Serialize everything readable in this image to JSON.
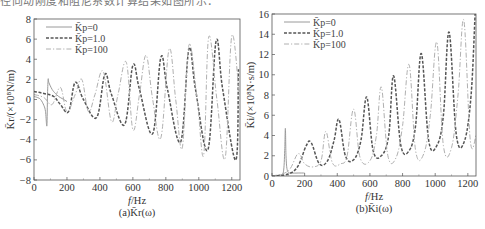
{
  "header_text": "径向动刚度和阻尼系数计算结果如图所示：",
  "chart_data": [
    {
      "id": "a",
      "type": "line",
      "title": "",
      "caption": "(a)K̄r(ω)",
      "xlabel": "f/Hz",
      "ylabel": "K̄r/(×10⁸N/m)",
      "xlim": [
        0,
        1250
      ],
      "ylim": [
        -8,
        8
      ],
      "xticks": [
        0,
        200,
        400,
        600,
        800,
        1000,
        1200
      ],
      "yticks": [
        -8,
        -6,
        -4,
        -2,
        0,
        2,
        4,
        6,
        8
      ],
      "grid": false,
      "legend_position": "upper-left",
      "series": [
        {
          "name": "K̄p=0",
          "style": "solid",
          "color": "#9a9a9a",
          "x": [
            0,
            20,
            40,
            60,
            70,
            78,
            82,
            86,
            90,
            110,
            130,
            150,
            170,
            200
          ],
          "y": [
            0.3,
            0.2,
            0.0,
            -0.6,
            -1.2,
            -2.6,
            0.5,
            2.0,
            1.7,
            1.0,
            0.6,
            0.3,
            0.1,
            -0.2
          ]
        },
        {
          "name": "K̄p=1.0",
          "style": "dashed",
          "color": "#555555",
          "x": [
            0,
            60,
            120,
            160,
            210,
            250,
            300,
            380,
            430,
            470,
            550,
            600,
            640,
            720,
            770,
            810,
            890,
            940,
            980,
            1055,
            1105,
            1145,
            1225,
            1240
          ],
          "y": [
            0.8,
            0.6,
            0.3,
            -0.5,
            -1.2,
            1.7,
            0.0,
            -1.8,
            2.5,
            0.5,
            -2.5,
            3.4,
            1.0,
            -3.4,
            4.2,
            1.0,
            -4.2,
            5.0,
            1.0,
            -5.0,
            5.8,
            1.0,
            -6.0,
            3.0
          ]
        },
        {
          "name": "K̄p=100",
          "style": "dash-dot",
          "color": "#b0b0b0",
          "x": [
            0,
            60,
            110,
            160,
            200,
            250,
            290,
            330,
            370,
            420,
            470,
            510,
            560,
            600,
            640,
            680,
            720,
            770,
            820,
            860,
            900,
            940,
            990,
            1030,
            1060,
            1110,
            1160,
            1200,
            1245
          ],
          "y": [
            0.5,
            0.2,
            -0.5,
            1.2,
            -1.2,
            0.5,
            2.0,
            -1.2,
            0.5,
            2.8,
            -2.2,
            0.5,
            3.7,
            -3.0,
            0.5,
            4.4,
            0.0,
            -3.8,
            5.0,
            0.0,
            -4.8,
            5.4,
            0.0,
            -5.5,
            6.2,
            0.0,
            -5.8,
            6.3,
            0.5
          ]
        }
      ]
    },
    {
      "id": "b",
      "type": "line",
      "title": "",
      "caption": "(b)K̄i(ω)",
      "xlabel": "f/Hz",
      "ylabel": "K̄i/(×10⁸N·s/m)",
      "xlim": [
        0,
        1250
      ],
      "ylim": [
        0,
        16
      ],
      "xticks": [
        0,
        200,
        400,
        600,
        800,
        1000,
        1200
      ],
      "yticks": [
        0,
        2,
        4,
        6,
        8,
        10,
        12,
        14,
        16
      ],
      "grid": false,
      "legend_position": "upper-left",
      "series": [
        {
          "name": "K̄p=0",
          "style": "solid",
          "color": "#9a9a9a",
          "x": [
            0,
            50,
            70,
            78,
            82,
            86,
            95,
            120,
            160,
            200
          ],
          "y": [
            0.0,
            0.1,
            0.4,
            2.5,
            4.7,
            2.0,
            0.5,
            0.3,
            0.3,
            0.3
          ]
        },
        {
          "name": "K̄p=1.0",
          "style": "dashed",
          "color": "#555555",
          "x": [
            0,
            100,
            160,
            210,
            240,
            290,
            340,
            380,
            410,
            450,
            500,
            545,
            580,
            620,
            670,
            715,
            745,
            790,
            840,
            880,
            915,
            960,
            1010,
            1050,
            1085,
            1130,
            1180,
            1220,
            1245
          ],
          "y": [
            0.0,
            0.2,
            1.0,
            3.0,
            3.3,
            1.2,
            1.5,
            3.5,
            5.6,
            2.0,
            1.6,
            3.5,
            7.8,
            2.5,
            2.0,
            4.0,
            9.9,
            3.0,
            2.5,
            5.0,
            12.1,
            3.5,
            3.0,
            6.0,
            14.2,
            4.0,
            3.5,
            8.0,
            16.2
          ]
        },
        {
          "name": "K̄p=100",
          "style": "dash-dot",
          "color": "#b0b0b0",
          "x": [
            0,
            100,
            160,
            200,
            250,
            300,
            330,
            370,
            420,
            460,
            500,
            540,
            600,
            640,
            670,
            710,
            760,
            800,
            840,
            880,
            930,
            970,
            1010,
            1050,
            1100,
            1140,
            1175,
            1215,
            1250
          ],
          "y": [
            0.0,
            0.5,
            2.2,
            1.2,
            0.9,
            1.5,
            4.4,
            1.3,
            1.2,
            2.0,
            6.6,
            1.8,
            1.5,
            4.0,
            8.8,
            2.0,
            1.8,
            5.0,
            11.0,
            2.5,
            2.2,
            6.0,
            13.2,
            3.0,
            2.8,
            8.0,
            15.4,
            3.5,
            4.0
          ]
        }
      ]
    }
  ]
}
